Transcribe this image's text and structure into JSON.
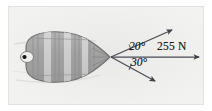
{
  "figure": {
    "name": "tugboat-force-diagram",
    "background_color": "#f2f2f1",
    "frame_color": "#e2e2e0"
  },
  "vessel": {
    "name": "barge",
    "hull_fill": "#a8a8a8",
    "hull_stroke": "#6e6e6e",
    "band_fill": "#cfcfcf",
    "rib_stroke": "#8a8a8a",
    "bow_marker": "bow-dot",
    "bow_marker_color": "#1a1a1a",
    "bow_ring_color": "#ffffff"
  },
  "vectors": {
    "origin_label": "tow-point",
    "color": "#4a4a55",
    "items": [
      {
        "name": "upper-rope-vector",
        "angle_label": "20°",
        "angle_value": 20,
        "direction": "above-resultant",
        "magnitude_label": ""
      },
      {
        "name": "resultant-force-vector",
        "angle_label": "",
        "angle_value": 0,
        "direction": "horizontal",
        "magnitude_label": "255 N"
      },
      {
        "name": "lower-rope-vector",
        "angle_label": "30°",
        "angle_value": 30,
        "direction": "below-resultant",
        "magnitude_label": ""
      }
    ]
  },
  "labels": {
    "angle_upper": "20°",
    "angle_lower": "30°",
    "force": "255 N"
  }
}
